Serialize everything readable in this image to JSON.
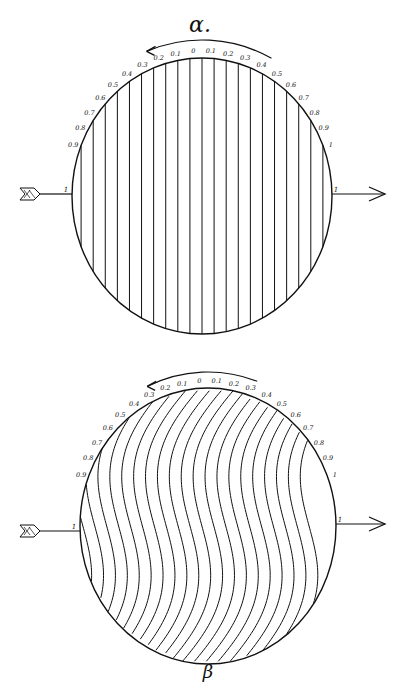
{
  "figure": {
    "ink_color": "#111111",
    "background": "#ffffff"
  },
  "panels": [
    {
      "id": "alpha",
      "caption": "α.",
      "caption_pos": [
        200,
        32
      ],
      "caption_size": 22,
      "circle": {
        "cx": 202,
        "cy": 196,
        "rx": 130,
        "ry": 138
      },
      "rotation_arrow": {
        "from_angle_deg": 62,
        "to_angle_deg": 112,
        "r_extra": 18,
        "direction": "counterclockwise"
      },
      "left_arrow": {
        "y": 194,
        "x_start": 20,
        "label": "1"
      },
      "right_arrow": {
        "y": 194,
        "x_end": 385,
        "label": "1"
      },
      "lines": "straight",
      "scale_labels": [
        "0.9",
        "0.8",
        "0.7",
        "0.6",
        "0.5",
        "0.4",
        "0.3",
        "0.2",
        "0.1",
        "0",
        "0.1",
        "0.2",
        "0.3",
        "0.4",
        "0.5",
        "0.6",
        "0.7",
        "0.8",
        "0.9",
        "1"
      ],
      "line_count": 21
    },
    {
      "id": "beta",
      "caption": "β",
      "caption_pos": [
        208,
        678
      ],
      "caption_size": 18,
      "circle": {
        "cx": 208,
        "cy": 526,
        "rx": 128,
        "ry": 138
      },
      "rotation_arrow": {
        "from_angle_deg": 70,
        "to_angle_deg": 115,
        "r_extra": 16,
        "direction": "counterclockwise"
      },
      "left_arrow": {
        "y": 531,
        "x_start": 20,
        "label": "1"
      },
      "right_arrow": {
        "y": 524,
        "x_end": 385,
        "label": "1"
      },
      "lines": "wavy",
      "scale_labels": [
        "0.9",
        "0.8",
        "0.7",
        "0.6",
        "0.5",
        "0.4",
        "0.3",
        "0.2",
        "0.1",
        "0",
        "0.1",
        "0.2",
        "0.3",
        "0.4",
        "0.5",
        "0.6",
        "0.7",
        "0.8",
        "0.9",
        "1"
      ],
      "line_count": 21
    }
  ]
}
